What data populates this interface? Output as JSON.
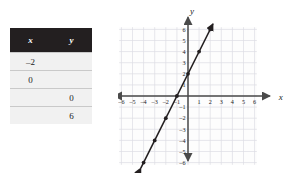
{
  "table": {
    "headers": [
      "x",
      "y"
    ],
    "rows": [
      {
        "x": "–2",
        "y": ""
      },
      {
        "x": "0",
        "y": ""
      },
      {
        "x": "",
        "y": "0"
      },
      {
        "x": "",
        "y": "6"
      }
    ]
  },
  "chart_data": {
    "type": "line",
    "title": "",
    "xlabel": "x",
    "ylabel": "y",
    "xlim": [
      -6.5,
      6.5
    ],
    "ylim": [
      -6.5,
      6.5
    ],
    "grid": true,
    "legend": null,
    "x_ticks": [
      "–6",
      "–5",
      "–4",
      "–3",
      "–2",
      "–1",
      "1",
      "2",
      "3",
      "4",
      "5",
      "6"
    ],
    "x_tick_values": [
      -6,
      -5,
      -4,
      -3,
      -2,
      -1,
      1,
      2,
      3,
      4,
      5,
      6
    ],
    "y_ticks": [
      "6",
      "5",
      "4",
      "3",
      "2",
      "1",
      "–1",
      "–2",
      "–3",
      "–4",
      "–5",
      "–6"
    ],
    "y_tick_values": [
      6,
      5,
      4,
      3,
      2,
      1,
      -1,
      -2,
      -3,
      -4,
      -5,
      -6
    ],
    "series": [
      {
        "name": "y = 2x + 2",
        "slope": 2,
        "intercept": 2,
        "x": [
          -4,
          -3,
          -2,
          -1,
          0,
          1,
          2
        ],
        "values": [
          -6,
          -4,
          -2,
          0,
          2,
          4,
          6
        ],
        "marked_points": [
          [
            -4,
            -6
          ],
          [
            -3,
            -4
          ],
          [
            -2,
            -2
          ],
          [
            -1,
            0
          ],
          [
            0,
            2
          ],
          [
            1,
            4
          ],
          [
            2,
            6
          ]
        ],
        "color": "#231f20"
      }
    ],
    "colors": {
      "grid": "#dcdce4",
      "axis": "#4a4a4a",
      "line": "#231f20",
      "background": "#fdfdfd"
    }
  }
}
